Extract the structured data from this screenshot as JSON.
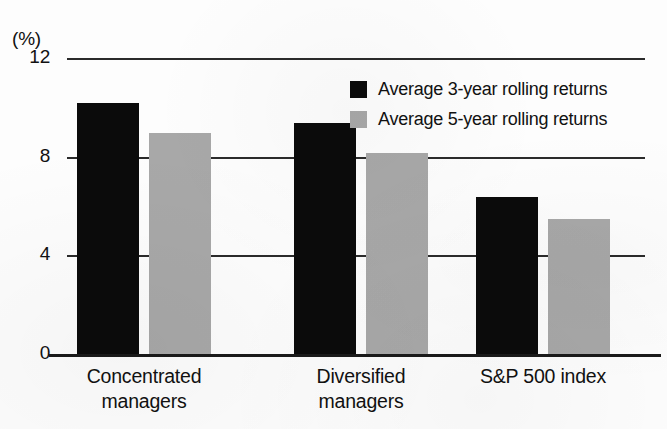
{
  "chart_data": {
    "type": "bar",
    "title": "",
    "subtitle": "",
    "xlabel": "",
    "ylabel": "",
    "unit_label": "(%)",
    "categories": [
      "Concentrated\nmanagers",
      "Diversified\nmanagers",
      "S&P 500 index"
    ],
    "series": [
      {
        "name": "Average 3-year rolling returns",
        "color": "#0b0b0b",
        "values": [
          10.2,
          9.4,
          6.4
        ]
      },
      {
        "name": "Average 5-year rolling returns",
        "color": "#a8a8a8",
        "values": [
          9.0,
          8.2,
          5.5
        ]
      }
    ],
    "ylim": [
      0,
      12
    ],
    "yticks": [
      0,
      4,
      8,
      12
    ],
    "ytick_labels": [
      "0",
      "4",
      "8",
      "12"
    ],
    "grid": "horizontal",
    "legend_position": "top-right-inside"
  },
  "axis": {
    "unit": "(%)",
    "ticks": [
      {
        "label": "12",
        "value": 12
      },
      {
        "label": "8",
        "value": 8
      },
      {
        "label": "4",
        "value": 4
      },
      {
        "label": "0",
        "value": 0
      }
    ]
  },
  "categories": [
    {
      "line1": "Concentrated",
      "line2": "managers"
    },
    {
      "line1": "Diversified",
      "line2": "managers"
    },
    {
      "line1": "S&P 500 index",
      "line2": ""
    }
  ],
  "legend": {
    "items": [
      {
        "label": "Average 3-year rolling returns",
        "color": "#0b0b0b"
      },
      {
        "label": "Average 5-year rolling returns",
        "color": "#a8a8a8"
      }
    ]
  }
}
